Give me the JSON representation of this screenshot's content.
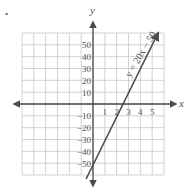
{
  "chart_data": {
    "type": "line",
    "title": "",
    "xlabel": "x",
    "ylabel": "y",
    "xlim": [
      -6,
      6
    ],
    "ylim": [
      -60,
      60
    ],
    "grid": true,
    "x_ticks": [
      1,
      2,
      3,
      4,
      5
    ],
    "y_ticks": [
      50,
      40,
      30,
      20,
      10,
      -10,
      -20,
      -30,
      -40,
      -50
    ],
    "series": [
      {
        "name": "y = 20x − 50",
        "equation": "y = 20x − 50",
        "slope": 20,
        "intercept": -50,
        "x": [
          -0.5,
          0,
          1,
          2,
          2.5,
          3,
          4,
          5,
          5.5
        ],
        "values": [
          -60,
          -50,
          -30,
          -10,
          0,
          10,
          30,
          50,
          60
        ]
      }
    ],
    "annotations": [
      {
        "text": "y = 20x − 50",
        "position": "along line, upper right",
        "rotation_deg": -59
      }
    ],
    "colors": {
      "line": "#4a4a4a",
      "axis": "#4a4a4a",
      "grid": "#c8c8c8",
      "text": "#555555"
    }
  },
  "labels": {
    "x_axis": "x",
    "y_axis": "y",
    "equation": "y = 20x − 50",
    "bullet": "•"
  }
}
